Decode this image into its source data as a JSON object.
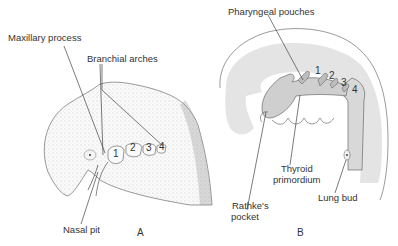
{
  "panels": {
    "a": {
      "letter": "A",
      "labels": {
        "maxillary": "Maxillary process",
        "branchial": "Branchial arches",
        "nasal": "Nasal pit"
      },
      "arch_numbers": [
        "1",
        "2",
        "3",
        "4"
      ]
    },
    "b": {
      "letter": "B",
      "labels": {
        "pouches": "Pharyngeal pouches",
        "thyroid_1": "Thyroid",
        "thyroid_2": "primordium",
        "rathke_1": "Rathke's",
        "rathke_2": "pocket",
        "lung": "Lung bud"
      },
      "pouch_numbers": [
        "1",
        "2",
        "3",
        "4"
      ]
    }
  },
  "colors": {
    "ink": "#333333",
    "gray_fill": "#e4e4e4",
    "stipple": "#b9b9b9"
  }
}
